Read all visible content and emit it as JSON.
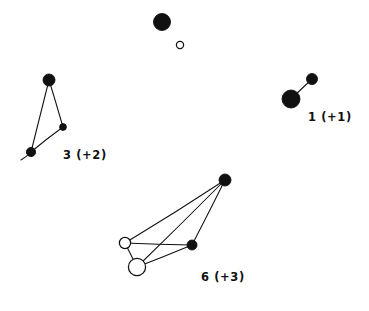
{
  "figure": {
    "title": "",
    "background_color": "#ffffff",
    "ink_color": "#111111",
    "width": 369,
    "height": 311
  },
  "chart_data": {
    "type": "scatter",
    "title": "",
    "xlabel": "",
    "ylabel": "",
    "xlim": [
      0,
      369
    ],
    "ylim": [
      0,
      311
    ],
    "grid": false,
    "legend": "none",
    "marker_styles": [
      {
        "name": "filled",
        "fill": "#111111",
        "stroke": "#111111"
      },
      {
        "name": "open",
        "fill": "#ffffff",
        "stroke": "#111111"
      }
    ],
    "clusters": [
      {
        "id": "top-pair",
        "label": "",
        "label_position": null,
        "nodes": [
          {
            "id": "t1",
            "x": 162,
            "y": 22,
            "r": 8.5,
            "style": "filled"
          },
          {
            "id": "t2",
            "x": 180,
            "y": 45,
            "r": 3.6,
            "style": "open"
          }
        ],
        "edges": []
      },
      {
        "id": "right-pair",
        "label": "1 (+1)",
        "label_x": 308,
        "label_y": 121,
        "nodes": [
          {
            "id": "r1",
            "x": 291,
            "y": 99,
            "r": 9.0,
            "style": "filled"
          },
          {
            "id": "r2",
            "x": 312,
            "y": 79,
            "r": 5.5,
            "style": "filled"
          }
        ],
        "edges": [
          {
            "from": "r1",
            "to": "r2"
          }
        ]
      },
      {
        "id": "left-triangle",
        "label": "3 (+2)",
        "label_x": 63,
        "label_y": 159,
        "nodes": [
          {
            "id": "l1",
            "x": 49,
            "y": 80,
            "r": 6.0,
            "style": "filled"
          },
          {
            "id": "l2",
            "x": 63,
            "y": 127,
            "r": 3.4,
            "style": "filled"
          },
          {
            "id": "l3",
            "x": 31,
            "y": 152,
            "r": 4.6,
            "style": "filled"
          }
        ],
        "edges": [
          {
            "from": "l1",
            "to": "l2"
          },
          {
            "from": "l1",
            "to": "l3"
          },
          {
            "from": "l2",
            "to": "l3"
          },
          {
            "from": "l3",
            "to": "tail",
            "tail_x": 21,
            "tail_y": 160
          }
        ]
      },
      {
        "id": "bottom-quad",
        "label": "6 (+3)",
        "label_x": 201,
        "label_y": 281,
        "nodes": [
          {
            "id": "b1",
            "x": 225,
            "y": 180,
            "r": 6.0,
            "style": "filled"
          },
          {
            "id": "b2",
            "x": 192,
            "y": 245,
            "r": 5.0,
            "style": "filled"
          },
          {
            "id": "b3",
            "x": 125,
            "y": 243,
            "r": 5.6,
            "style": "open"
          },
          {
            "id": "b4",
            "x": 137,
            "y": 267,
            "r": 8.6,
            "style": "open"
          }
        ],
        "edges": [
          {
            "from": "b1",
            "to": "b2"
          },
          {
            "from": "b1",
            "to": "b3"
          },
          {
            "from": "b1",
            "to": "b4"
          },
          {
            "from": "b2",
            "to": "b3"
          },
          {
            "from": "b2",
            "to": "b4"
          },
          {
            "from": "b3",
            "to": "b4"
          }
        ]
      }
    ],
    "labels": [
      {
        "text": "1 (+1)",
        "x": 308,
        "y": 121
      },
      {
        "text": "3 (+2)",
        "x": 63,
        "y": 159
      },
      {
        "text": "6 (+3)",
        "x": 201,
        "y": 281
      }
    ]
  }
}
